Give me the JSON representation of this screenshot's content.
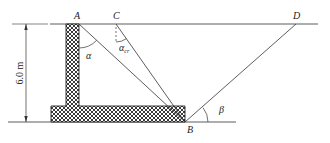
{
  "diagram": {
    "type": "retaining-wall-wedge",
    "labels": {
      "A": "A",
      "B": "B",
      "C": "C",
      "D": "D",
      "alpha": "α",
      "alpha_cr": "αcr",
      "alpha_cr_main": "α",
      "alpha_cr_sub": "cr",
      "beta": "β"
    },
    "dimension": {
      "height_label": "6.0 m"
    },
    "colors": {
      "line": "#333333",
      "hatch": "#222222",
      "background": "#ffffff"
    }
  }
}
